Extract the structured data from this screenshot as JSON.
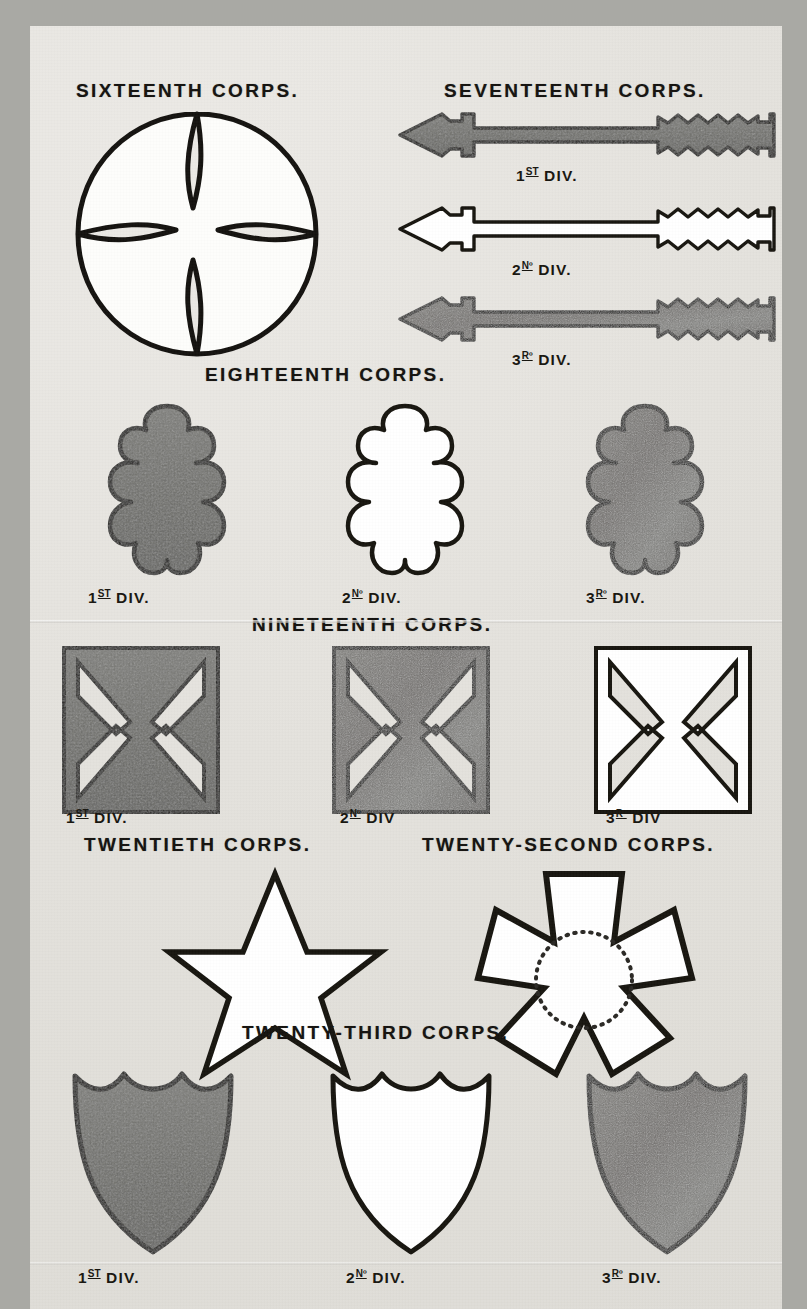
{
  "plate": {
    "background_color": "#e3e1dc",
    "ink_color": "#14120f",
    "fill_dark": "#6e6e6a",
    "fill_light": "#ffffff",
    "fill_mottled": "#757571"
  },
  "sections": [
    {
      "id": "sixteenth",
      "title": "SIXTEENTH CORPS.",
      "badge_shape": "circle-with-four-crescent-notches",
      "divisions": []
    },
    {
      "id": "seventeenth",
      "title": "SEVENTEENTH CORPS.",
      "badge_shape": "arrow",
      "divisions": [
        {
          "label": "1",
          "ordinal": "ST",
          "suffix": " DIV.",
          "full": "1ST DIV.",
          "fill": "dark"
        },
        {
          "label": "2",
          "ordinal": "Nº",
          "suffix": " DIV.",
          "full": "2Nº DIV.",
          "fill": "light"
        },
        {
          "label": "3",
          "ordinal": "Rº",
          "suffix": " DIV.",
          "full": "3Rº DIV.",
          "fill": "mottled"
        }
      ]
    },
    {
      "id": "eighteenth",
      "title": "EIGHTEENTH CORPS.",
      "badge_shape": "trefoil-cross",
      "divisions": [
        {
          "label": "1",
          "ordinal": "ST",
          "suffix": " DIV.",
          "full": "1ST DIV.",
          "fill": "dark"
        },
        {
          "label": "2",
          "ordinal": "Nº",
          "suffix": " DIV.",
          "full": "2Nº DIV.",
          "fill": "light"
        },
        {
          "label": "3",
          "ordinal": "Rº",
          "suffix": " DIV.",
          "full": "3Rº DIV.",
          "fill": "mottled"
        }
      ]
    },
    {
      "id": "nineteenth",
      "title": "NINETEENTH CORPS.",
      "badge_shape": "fan-cross",
      "divisions": [
        {
          "label": "1",
          "ordinal": "ST",
          "suffix": " DIV.",
          "full": "1ST DIV.",
          "fill": "dark"
        },
        {
          "label": "2",
          "ordinal": "Nº",
          "suffix": " DIV",
          "full": "2Nº DIV",
          "fill": "mottled"
        },
        {
          "label": "3",
          "ordinal": "Rº",
          "suffix": " DIV",
          "full": "3Rº DIV",
          "fill": "light"
        }
      ]
    },
    {
      "id": "twentieth",
      "title": "TWENTIETH CORPS.",
      "badge_shape": "five-pointed-star",
      "divisions": []
    },
    {
      "id": "twenty_second",
      "title": "TWENTY-SECOND CORPS.",
      "badge_shape": "pentagonal-cross-with-dotted-circle",
      "divisions": []
    },
    {
      "id": "twenty_third",
      "title": "TWENTY-THIRD CORPS.",
      "badge_shape": "shield",
      "divisions": [
        {
          "label": "1",
          "ordinal": "ST",
          "suffix": " DIV.",
          "full": "1ST DIV.",
          "fill": "dark"
        },
        {
          "label": "2",
          "ordinal": "Nº",
          "suffix": " DIV.",
          "full": "2Nº DIV.",
          "fill": "light"
        },
        {
          "label": "3",
          "ordinal": "Rº",
          "suffix": " DIV.",
          "full": "3Rº DIV.",
          "fill": "mottled"
        }
      ]
    }
  ]
}
